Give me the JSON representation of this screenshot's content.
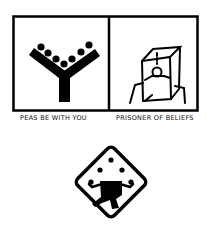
{
  "panels": [
    {
      "caption": "PEAS BE WITH YOU",
      "icon": "y-shape-with-peas-icon"
    },
    {
      "caption": "PRISONER OF BELIEFS",
      "icon": "person-in-box-icon"
    }
  ],
  "sign": {
    "icon": "juggler-warning-sign-icon"
  },
  "colors": {
    "ink": "#000000",
    "paper": "#ffffff"
  }
}
